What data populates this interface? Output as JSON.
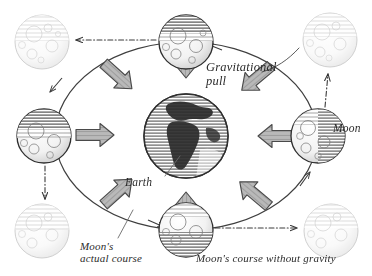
{
  "figure": {
    "style": "engraved line-art / crosshatch illustration",
    "background_color": "#ffffff",
    "ink_color": "#2b2b2b",
    "arrow_fill": "#b4b4b4",
    "arrow_stroke": "#4a4a4a",
    "ghost_opacity": "0.45"
  },
  "labels": {
    "gravitational_pull": "Gravitational\npull",
    "earth": "Earth",
    "moon": "Moon",
    "moons_actual_course": "Moon's\nactual course",
    "moons_course_without_gravity": "Moon's course without gravity"
  },
  "bodies": {
    "earth": {
      "name": "Earth",
      "cx": 186,
      "cy": 136,
      "r": 42
    },
    "moons_on_orbit": [
      {
        "position": "top",
        "cx": 186,
        "cy": 42,
        "r": 27
      },
      {
        "position": "left",
        "cx": 44,
        "cy": 136,
        "r": 27
      },
      {
        "position": "right",
        "cx": 318,
        "cy": 136,
        "r": 27
      },
      {
        "position": "bottom",
        "cx": 186,
        "cy": 230,
        "r": 27
      }
    ],
    "ghost_moons": [
      {
        "position": "top-left",
        "cx": 42,
        "cy": 42,
        "r": 27
      },
      {
        "position": "top-right",
        "cx": 330,
        "cy": 40,
        "r": 27
      },
      {
        "position": "bottom-left",
        "cx": 42,
        "cy": 231,
        "r": 27
      },
      {
        "position": "bottom-right",
        "cx": 331,
        "cy": 231,
        "r": 27
      }
    ]
  },
  "orbit": {
    "shape": "ellipse",
    "cx": 186,
    "cy": 136,
    "rx": 131,
    "ry": 94,
    "line_style": "solid",
    "direction_arrows": 4
  },
  "inertia_paths": {
    "line_style": "dash-dot",
    "meaning": "Moon's course without gravity (straight tangent)",
    "arrows": [
      {
        "from": "top moon",
        "to": "top-left ghost moon",
        "direction": "left"
      },
      {
        "from": "left moon",
        "to": "bottom-left ghost moon",
        "direction": "down"
      },
      {
        "from": "bottom moon",
        "to": "bottom-right ghost moon",
        "direction": "right"
      },
      {
        "from": "right moon",
        "to": "top-right ghost moon",
        "direction": "up"
      }
    ]
  },
  "gravity_arrows": {
    "meaning": "Gravitational pull toward Earth",
    "count": 6,
    "directions": [
      "from-top",
      "from-upper-left",
      "from-upper-right",
      "from-left",
      "from-right",
      "from-bottom",
      "from-lower-left",
      "from-lower-right"
    ]
  }
}
